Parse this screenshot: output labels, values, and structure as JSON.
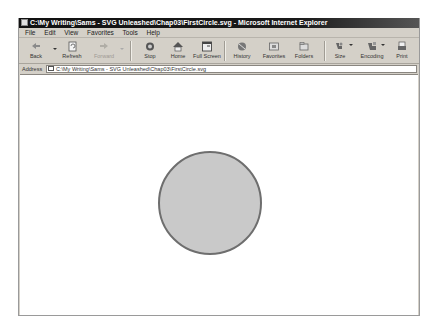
{
  "window": {
    "title": "C:\\My Writing\\Sams - SVG Unleashed\\Chap03\\FirstCircle.svg - Microsoft Internet Explorer"
  },
  "menubar": {
    "items": [
      "File",
      "Edit",
      "View",
      "Favorites",
      "Tools",
      "Help"
    ]
  },
  "toolbar": {
    "buttons": [
      {
        "label": "Back",
        "icon": "back-arrow-icon",
        "enabled": true
      },
      {
        "label": "Refresh",
        "icon": "refresh-icon",
        "enabled": true
      },
      {
        "label": "Forward",
        "icon": "forward-arrow-icon",
        "enabled": false
      },
      {
        "label": "Stop",
        "icon": "stop-icon",
        "enabled": true
      },
      {
        "label": "Home",
        "icon": "home-icon",
        "enabled": true
      },
      {
        "label": "Full Screen",
        "icon": "fullscreen-icon",
        "enabled": true
      },
      {
        "label": "History",
        "icon": "history-icon",
        "enabled": true
      },
      {
        "label": "Favorites",
        "icon": "favorites-icon",
        "enabled": true
      },
      {
        "label": "Folders",
        "icon": "folders-icon",
        "enabled": true
      },
      {
        "label": "Size",
        "icon": "size-icon",
        "enabled": true
      },
      {
        "label": "Encoding",
        "icon": "encoding-icon",
        "enabled": true
      },
      {
        "label": "Print",
        "icon": "print-icon",
        "enabled": true
      }
    ]
  },
  "addressbar": {
    "label": "Address",
    "value": "C:\\My Writing\\Sams - SVG Unleashed\\Chap03\\FirstCircle.svg"
  },
  "content": {
    "circle": {
      "cx": 190,
      "cy": 128,
      "r": 51,
      "fill": "#c9c9c9",
      "stroke": "#6e6e6e",
      "stroke_width": 2
    }
  },
  "colors": {
    "chrome": "#d4d0c8",
    "titlebar": "#111111",
    "content_bg": "#ffffff"
  }
}
